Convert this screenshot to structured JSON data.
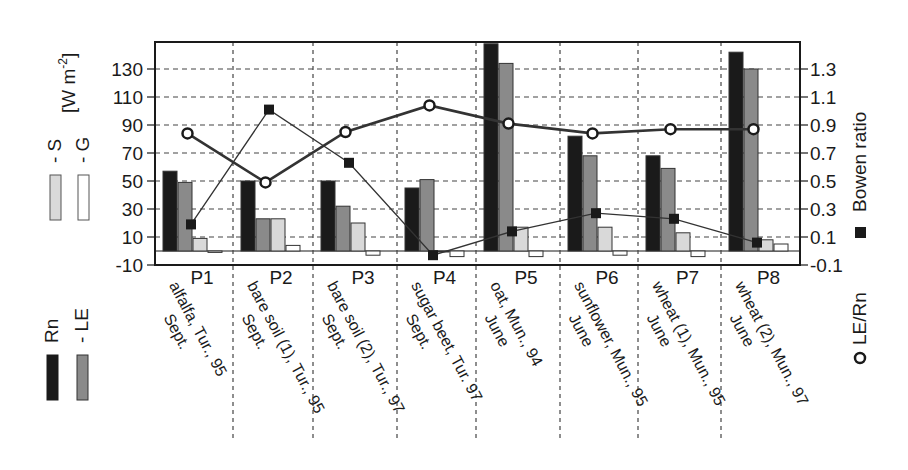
{
  "chart_data": {
    "type": "bar",
    "title": "",
    "xlabel": "",
    "ylabel": "[W m-2]",
    "ylabel_parts": {
      "main": "[W m",
      "sup": "-2",
      "close": "]"
    },
    "y2label": "Bowen ratio",
    "ylim": [
      -10,
      150
    ],
    "y2lim": [
      -0.1,
      1.5
    ],
    "grid": true,
    "yticks": [
      -10,
      10,
      30,
      50,
      70,
      90,
      110,
      130
    ],
    "ytick_labels": [
      "-10",
      "10",
      "30",
      "50",
      "70",
      "90",
      "110",
      "130"
    ],
    "y2ticks": [
      -0.1,
      0.1,
      0.3,
      0.5,
      0.7,
      0.9,
      1.1,
      1.3
    ],
    "y2tick_labels": [
      "-0.1",
      "0.1",
      "0.3",
      "0.5",
      "0.7",
      "0.9",
      "1.1",
      "1.3"
    ],
    "categories": [
      "P1",
      "P2",
      "P3",
      "P4",
      "P5",
      "P6",
      "P7",
      "P8"
    ],
    "category_descriptions": [
      [
        "alfalfa, Tur., 95",
        "Sept."
      ],
      [
        "bare soil (1), Tur., 95",
        "Sept."
      ],
      [
        "bare soil (2), Tur., 97",
        "Sept."
      ],
      [
        "sugar beet, Tur. 97",
        "Sept."
      ],
      [
        "oat, Mun., 94",
        "June"
      ],
      [
        "sunflower, Mun., 95",
        "June"
      ],
      [
        "wheat (1), Mun., 95",
        "June"
      ],
      [
        "wheat (2), Mun., 97",
        "June"
      ]
    ],
    "series": [
      {
        "name": "Rn",
        "kind": "bar",
        "axis": "left",
        "color": "#1a1a1a",
        "values": [
          57,
          50,
          50,
          45,
          148,
          82,
          68,
          142
        ]
      },
      {
        "name": "LE",
        "kind": "bar",
        "axis": "left",
        "color": "#8a8a8a",
        "values": [
          49,
          23,
          32,
          51,
          134,
          68,
          59,
          130
        ]
      },
      {
        "name": "S",
        "kind": "bar",
        "axis": "left",
        "color": "#d9d9d9",
        "values": [
          9,
          23,
          20,
          0,
          17,
          17,
          13,
          8
        ]
      },
      {
        "name": "G",
        "kind": "bar",
        "axis": "left",
        "color": "#ffffff",
        "values": [
          -1,
          4,
          -3,
          -4,
          -4,
          -3,
          -4,
          5
        ]
      },
      {
        "name": "LE/Rn",
        "kind": "line",
        "marker": "circle",
        "axis": "right",
        "color": "#333333",
        "values": [
          0.84,
          0.49,
          0.85,
          1.04,
          0.91,
          0.84,
          0.87,
          0.87
        ]
      },
      {
        "name": "Bowen ratio",
        "kind": "line",
        "marker": "square",
        "axis": "right",
        "color": "#333333",
        "values": [
          0.19,
          1.01,
          0.63,
          -0.03,
          0.14,
          0.27,
          0.23,
          0.06
        ]
      }
    ],
    "legend": {
      "left": [
        {
          "label": "Rn",
          "prefix": "",
          "swatch": "#1a1a1a"
        },
        {
          "label": "LE",
          "prefix": "- ",
          "swatch": "#8a8a8a"
        },
        {
          "label": "S",
          "prefix": "- ",
          "swatch": "#d9d9d9"
        },
        {
          "label": "G",
          "prefix": "- ",
          "swatch": "#ffffff"
        }
      ],
      "right": [
        {
          "label": "LE/Rn",
          "marker": "o"
        },
        {
          "label": "Bowen ratio",
          "marker": "■"
        }
      ]
    }
  },
  "labels": {
    "legend_rn": "Rn",
    "legend_le": "- LE",
    "legend_s": "- S",
    "legend_g": "- G",
    "legend_units": "[W m",
    "legend_units_sup": "-2",
    "legend_units_close": "]",
    "legend_lern": "LE/Rn",
    "legend_bowen": "Bowen ratio"
  }
}
